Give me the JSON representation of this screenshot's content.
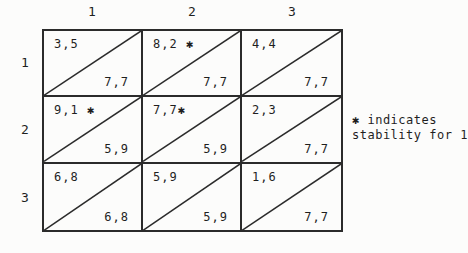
{
  "figure": {
    "kind": "payoff-matrix",
    "description_visible": false
  },
  "matrix": {
    "col_headers": [
      "1",
      "2",
      "3"
    ],
    "row_headers": [
      "1",
      "2",
      "3"
    ],
    "cells": [
      {
        "row": "1",
        "col": "1",
        "top": "3,5",
        "bottom": "7,7"
      },
      {
        "row": "1",
        "col": "2",
        "top": "8,2 ✱",
        "bottom": "7,7"
      },
      {
        "row": "1",
        "col": "3",
        "top": "4,4",
        "bottom": "7,7"
      },
      {
        "row": "2",
        "col": "1",
        "top": "9,1 ✱",
        "bottom": "5,9"
      },
      {
        "row": "2",
        "col": "2",
        "top": "7,7✱",
        "bottom": "5,9"
      },
      {
        "row": "2",
        "col": "3",
        "top": "2,3",
        "bottom": "7,7"
      },
      {
        "row": "3",
        "col": "1",
        "top": "6,8",
        "bottom": "6,8"
      },
      {
        "row": "3",
        "col": "2",
        "top": "5,9",
        "bottom": "5,9"
      },
      {
        "row": "3",
        "col": "3",
        "top": "1,6",
        "bottom": "7,7"
      }
    ]
  },
  "note": {
    "line1": "✱ indicates",
    "line2": "stability for 1"
  },
  "colors": {
    "background": "#fcfcfb",
    "line": "#2b2b2b",
    "text": "#1f1f1f"
  }
}
